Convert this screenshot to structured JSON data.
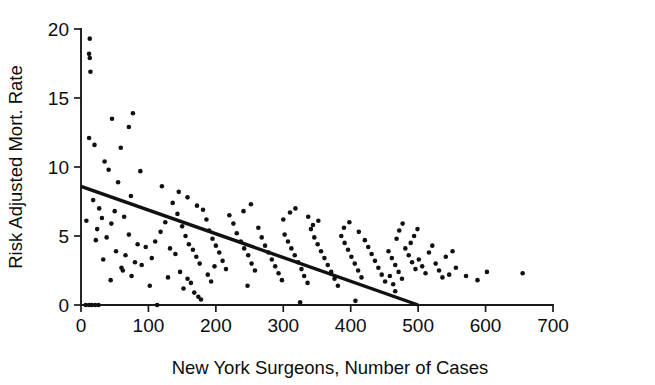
{
  "chart_data": {
    "type": "scatter",
    "title": "",
    "xlabel": "New York Surgeons, Number of Cases",
    "ylabel": "Risk Adjusted Mort. Rate",
    "xlim": [
      0,
      700
    ],
    "ylim": [
      0,
      20
    ],
    "xticks": [
      0,
      100,
      200,
      300,
      400,
      500,
      600,
      700
    ],
    "yticks": [
      0,
      5,
      10,
      15,
      20
    ],
    "xtick_labels": [
      "0",
      "100",
      "200",
      "300",
      "400",
      "500",
      "600",
      "700"
    ],
    "ytick_labels": [
      "0",
      "5",
      "10",
      "15",
      "20"
    ],
    "grid": false,
    "legend": null,
    "marker_color": "#111111",
    "line_color": "#111111",
    "axis_color": "#1a1a1a",
    "background_color": "#ffffff",
    "trend_line": {
      "name": "least-squares fit",
      "x": [
        0,
        500
      ],
      "y": [
        8.6,
        0.0
      ],
      "slope": -0.0172,
      "intercept": 8.6
    },
    "series": [
      {
        "name": "New York surgeons",
        "n_points": 176,
        "points": [
          [
            7,
            0.0
          ],
          [
            12,
            0.0
          ],
          [
            16,
            0.0
          ],
          [
            21,
            0.0
          ],
          [
            26,
            0.0
          ],
          [
            13,
            19.3
          ],
          [
            12,
            18.2
          ],
          [
            13,
            17.9
          ],
          [
            14,
            16.9
          ],
          [
            12,
            12.1
          ],
          [
            46,
            13.5
          ],
          [
            77,
            13.9
          ],
          [
            71,
            12.9
          ],
          [
            20,
            11.6
          ],
          [
            59,
            11.4
          ],
          [
            35,
            10.4
          ],
          [
            41,
            9.8
          ],
          [
            88,
            9.7
          ],
          [
            55,
            8.9
          ],
          [
            120,
            8.6
          ],
          [
            74,
            7.9
          ],
          [
            8,
            6.1
          ],
          [
            45,
            5.9
          ],
          [
            64,
            6.4
          ],
          [
            24,
            5.5
          ],
          [
            71,
            5.1
          ],
          [
            84,
            4.4
          ],
          [
            96,
            4.2
          ],
          [
            33,
            3.3
          ],
          [
            60,
            2.7
          ],
          [
            62,
            2.5
          ],
          [
            75,
            2.1
          ],
          [
            44,
            1.8
          ],
          [
            113,
            0.0
          ],
          [
            102,
            1.4
          ],
          [
            129,
            2.0
          ],
          [
            18,
            7.6
          ],
          [
            27,
            7.0
          ],
          [
            31,
            6.3
          ],
          [
            50,
            6.8
          ],
          [
            22,
            4.7
          ],
          [
            38,
            4.9
          ],
          [
            52,
            3.9
          ],
          [
            66,
            3.6
          ],
          [
            80,
            3.1
          ],
          [
            90,
            2.9
          ],
          [
            105,
            3.4
          ],
          [
            110,
            4.6
          ],
          [
            118,
            5.3
          ],
          [
            125,
            6.0
          ],
          [
            132,
            4.1
          ],
          [
            140,
            3.7
          ],
          [
            147,
            2.4
          ],
          [
            152,
            1.2
          ],
          [
            158,
            1.9
          ],
          [
            163,
            1.6
          ],
          [
            168,
            0.9
          ],
          [
            174,
            0.6
          ],
          [
            178,
            0.4
          ],
          [
            136,
            7.4
          ],
          [
            143,
            6.6
          ],
          [
            150,
            5.7
          ],
          [
            155,
            5.0
          ],
          [
            160,
            4.4
          ],
          [
            166,
            4.0
          ],
          [
            171,
            3.5
          ],
          [
            176,
            3.0
          ],
          [
            181,
            6.9
          ],
          [
            186,
            6.2
          ],
          [
            190,
            5.4
          ],
          [
            195,
            4.8
          ],
          [
            200,
            4.3
          ],
          [
            205,
            3.8
          ],
          [
            210,
            3.2
          ],
          [
            215,
            2.6
          ],
          [
            188,
            2.2
          ],
          [
            193,
            1.7
          ],
          [
            198,
            2.8
          ],
          [
            145,
            8.2
          ],
          [
            158,
            7.8
          ],
          [
            172,
            7.2
          ],
          [
            220,
            6.5
          ],
          [
            226,
            5.9
          ],
          [
            231,
            5.2
          ],
          [
            237,
            4.6
          ],
          [
            242,
            4.1
          ],
          [
            248,
            3.6
          ],
          [
            253,
            3.0
          ],
          [
            258,
            2.5
          ],
          [
            263,
            5.6
          ],
          [
            268,
            4.9
          ],
          [
            273,
            4.3
          ],
          [
            278,
            3.8
          ],
          [
            283,
            3.3
          ],
          [
            288,
            2.8
          ],
          [
            293,
            2.3
          ],
          [
            298,
            1.8
          ],
          [
            241,
            6.8
          ],
          [
            252,
            7.3
          ],
          [
            247,
            1.4
          ],
          [
            302,
            5.1
          ],
          [
            307,
            4.6
          ],
          [
            312,
            4.1
          ],
          [
            317,
            3.6
          ],
          [
            322,
            3.1
          ],
          [
            327,
            2.6
          ],
          [
            331,
            2.1
          ],
          [
            336,
            1.6
          ],
          [
            325,
            0.2
          ],
          [
            341,
            5.5
          ],
          [
            346,
            4.9
          ],
          [
            351,
            4.4
          ],
          [
            356,
            3.9
          ],
          [
            361,
            3.4
          ],
          [
            366,
            2.9
          ],
          [
            371,
            2.4
          ],
          [
            376,
            1.9
          ],
          [
            381,
            1.4
          ],
          [
            300,
            6.2
          ],
          [
            310,
            6.7
          ],
          [
            318,
            7.0
          ],
          [
            352,
            6.1
          ],
          [
            344,
            5.8
          ],
          [
            337,
            6.4
          ],
          [
            386,
            5.0
          ],
          [
            391,
            4.5
          ],
          [
            396,
            4.0
          ],
          [
            401,
            3.5
          ],
          [
            406,
            3.0
          ],
          [
            407,
            0.3
          ],
          [
            411,
            2.5
          ],
          [
            416,
            2.0
          ],
          [
            421,
            4.7
          ],
          [
            426,
            4.2
          ],
          [
            431,
            3.7
          ],
          [
            436,
            3.2
          ],
          [
            441,
            2.7
          ],
          [
            446,
            2.2
          ],
          [
            451,
            1.7
          ],
          [
            390,
            5.6
          ],
          [
            398,
            6.0
          ],
          [
            412,
            5.3
          ],
          [
            456,
            3.9
          ],
          [
            461,
            3.4
          ],
          [
            466,
            2.9
          ],
          [
            466,
            1.0
          ],
          [
            471,
            2.4
          ],
          [
            476,
            1.9
          ],
          [
            481,
            4.1
          ],
          [
            486,
            3.6
          ],
          [
            491,
            3.1
          ],
          [
            496,
            2.6
          ],
          [
            468,
            4.8
          ],
          [
            472,
            5.4
          ],
          [
            477,
            5.9
          ],
          [
            458,
            2.1
          ],
          [
            463,
            1.5
          ],
          [
            501,
            3.3
          ],
          [
            506,
            2.8
          ],
          [
            511,
            2.3
          ],
          [
            516,
            3.8
          ],
          [
            521,
            4.3
          ],
          [
            526,
            3.0
          ],
          [
            531,
            2.5
          ],
          [
            536,
            2.0
          ],
          [
            541,
            3.5
          ],
          [
            546,
            2.2
          ],
          [
            551,
            3.9
          ],
          [
            556,
            2.7
          ],
          [
            489,
            4.5
          ],
          [
            494,
            5.0
          ],
          [
            499,
            5.5
          ],
          [
            571,
            2.1
          ],
          [
            588,
            1.8
          ],
          [
            602,
            2.4
          ],
          [
            655,
            2.3
          ]
        ]
      }
    ]
  },
  "axes": {
    "ylabel_text": "Risk Adjusted Mort. Rate",
    "xlabel_text": "New York Surgeons, Number of Cases"
  }
}
